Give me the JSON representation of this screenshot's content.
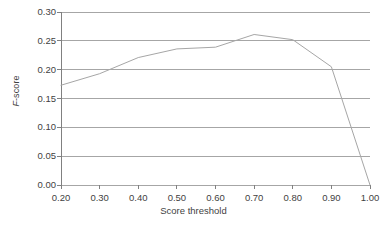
{
  "chart_data": {
    "type": "line",
    "title": "",
    "xlabel": "Score threshold",
    "ylabel": "F-score",
    "ylabel_parts": {
      "italic": "F",
      "rest": "-score"
    },
    "x": [
      0.2,
      0.3,
      0.4,
      0.5,
      0.6,
      0.7,
      0.8,
      0.9,
      1.0
    ],
    "values": [
      0.173,
      0.193,
      0.221,
      0.236,
      0.239,
      0.261,
      0.252,
      0.205,
      0.0
    ],
    "series": [
      {
        "name": "F-score",
        "values": [
          0.173,
          0.193,
          0.221,
          0.236,
          0.239,
          0.261,
          0.252,
          0.205,
          0.0
        ]
      }
    ],
    "xlim": [
      0.2,
      1.0
    ],
    "ylim": [
      0.0,
      0.3
    ],
    "xticks": [
      0.2,
      0.3,
      0.4,
      0.5,
      0.6,
      0.7,
      0.8,
      0.9,
      1.0
    ],
    "xtick_labels": [
      "0.20",
      "0.30",
      "0.40",
      "0.50",
      "0.60",
      "0.70",
      "0.80",
      "0.90",
      "1.00"
    ],
    "yticks": [
      0.0,
      0.05,
      0.1,
      0.15,
      0.2,
      0.25,
      0.3
    ],
    "ytick_labels": [
      "0.00",
      "0.05",
      "0.10",
      "0.15",
      "0.20",
      "0.25",
      "0.30"
    ],
    "grid": {
      "horizontal": true,
      "vertical": false
    },
    "legend": {
      "visible": false,
      "position": "none"
    },
    "colors": {
      "line": "#a6a6a6",
      "grid": "#a6a6a6",
      "axis": "#808080",
      "text": "#3f3f3f",
      "background": "#ffffff"
    },
    "line_width": 1
  },
  "plot_geometry": {
    "left": 61,
    "right": 370,
    "top": 12,
    "bottom": 185
  }
}
